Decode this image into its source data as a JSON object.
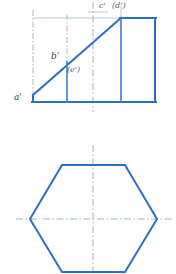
{
  "drawing": {
    "title": "Hexagonal prism truncated by inclined plane — orthographic projection",
    "colors": {
      "object_line": "#2E6FBF",
      "center_line": "#9FB3C8",
      "projection_line": "#B9C6D4",
      "label_text": "#2C3E50",
      "background": "#ffffff"
    },
    "front_view": {
      "name": "front-view",
      "labels": [
        {
          "id": "a-prime",
          "text": "a'",
          "x": 14,
          "y": 100
        },
        {
          "id": "b-prime",
          "text": "b'",
          "x": 51,
          "y": 59
        },
        {
          "id": "e-prime",
          "text": "(e')",
          "x": 67,
          "y": 72
        },
        {
          "id": "c-prime",
          "text": "c'",
          "x": 99,
          "y": 8
        },
        {
          "id": "d-prime",
          "text": "(d')",
          "x": 113,
          "y": 8
        }
      ],
      "outline": {
        "left": 33,
        "right": 155,
        "bottom": 102,
        "top": 18,
        "apex_left_y": 95,
        "apex_right_x": 121
      },
      "vertical_edges_x": [
        33,
        67,
        121,
        155
      ],
      "cut_line": {
        "x1": 33,
        "y1": 95,
        "x2": 121,
        "y2": 18
      }
    },
    "top_view": {
      "name": "top-view",
      "hexagon_points": "30,219 62,165 125,165 157,219 125,272 62,272",
      "center_x": 93,
      "center_y": 219
    },
    "center_lines": {
      "vertical_x": 93,
      "horizontal_y": 219
    }
  }
}
